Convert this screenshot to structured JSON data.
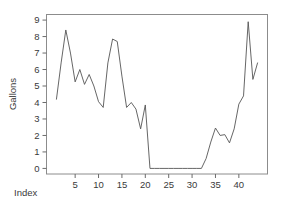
{
  "chart_data": {
    "type": "line",
    "title": "",
    "subtitle": "",
    "xlabel": "Index",
    "ylabel": "Gallons",
    "xlim": [
      1,
      44
    ],
    "ylim": [
      0,
      9
    ],
    "grid": false,
    "legend": null,
    "x_ticks": [
      5,
      10,
      15,
      20,
      25,
      30,
      35,
      40
    ],
    "y_ticks": [
      0,
      1,
      2,
      3,
      4,
      5,
      6,
      7,
      8,
      9
    ],
    "x": [
      1,
      2,
      3,
      4,
      5,
      6,
      7,
      8,
      9,
      10,
      11,
      12,
      13,
      14,
      15,
      16,
      17,
      18,
      19,
      20,
      21,
      22,
      23,
      24,
      25,
      26,
      27,
      28,
      29,
      30,
      31,
      32,
      33,
      34,
      35,
      36,
      37,
      38,
      39,
      40,
      41,
      42,
      43,
      44
    ],
    "values": [
      4.2,
      6.4,
      8.4,
      7.0,
      5.25,
      6.0,
      5.1,
      5.7,
      5.0,
      4.05,
      3.7,
      6.4,
      7.85,
      7.7,
      5.6,
      3.7,
      4.0,
      3.6,
      2.4,
      3.85,
      0.0,
      0.0,
      0.0,
      0.0,
      0.0,
      0.0,
      0.0,
      0.0,
      0.0,
      0.0,
      0.0,
      0.0,
      0.6,
      1.6,
      2.45,
      2.0,
      2.05,
      1.55,
      2.4,
      3.9,
      4.4,
      8.9,
      5.4,
      6.4
    ],
    "series_color": "#555555",
    "axis_color": "#6b6b6b",
    "frame_color": "#8c8c8c",
    "background": "#ffffff"
  },
  "axis": {
    "y_label": "Gallons",
    "x_label": "Index",
    "y_tick_labels": [
      "0",
      "1",
      "2",
      "3",
      "4",
      "5",
      "6",
      "7",
      "8",
      "9"
    ],
    "x_tick_labels": [
      "5",
      "10",
      "15",
      "20",
      "25",
      "30",
      "35",
      "40"
    ]
  }
}
